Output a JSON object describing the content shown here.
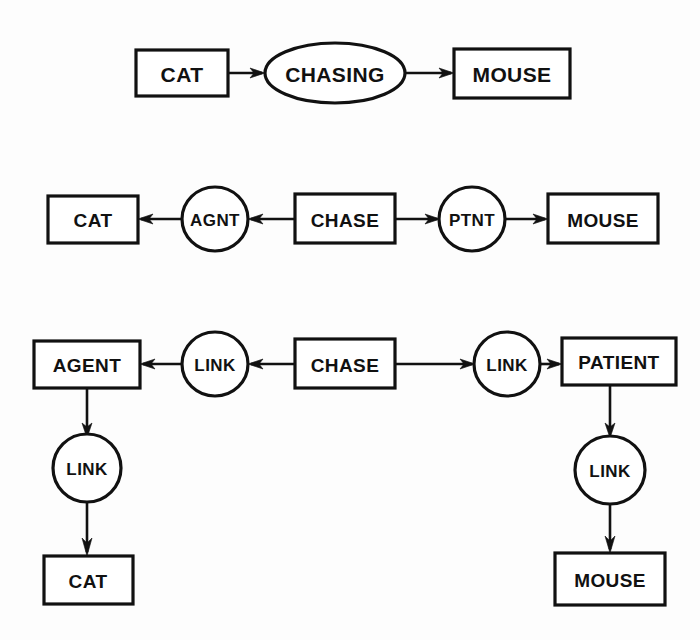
{
  "diagram": {
    "background_color": "#fdfdfd",
    "line_color": "#111111",
    "fill_color": "#ffffff",
    "rows": [
      {
        "id": "row-1",
        "description": "Binary relation: CAT -> CHASING -> MOUSE",
        "nodes": [
          {
            "id": "r1-cat",
            "label": "CAT",
            "shape": "rect"
          },
          {
            "id": "r1-chasing",
            "label": "CHASING",
            "shape": "ellipse"
          },
          {
            "id": "r1-mouse",
            "label": "MOUSE",
            "shape": "rect"
          }
        ],
        "edges": [
          {
            "from": "r1-cat",
            "to": "r1-chasing",
            "direction": "right"
          },
          {
            "from": "r1-chasing",
            "to": "r1-mouse",
            "direction": "right"
          }
        ]
      },
      {
        "id": "row-2",
        "description": "Case-role representation with AGNT and PTNT relations",
        "nodes": [
          {
            "id": "r2-cat",
            "label": "CAT",
            "shape": "rect"
          },
          {
            "id": "r2-agnt",
            "label": "AGNT",
            "shape": "circle"
          },
          {
            "id": "r2-chase",
            "label": "CHASE",
            "shape": "rect"
          },
          {
            "id": "r2-ptnt",
            "label": "PTNT",
            "shape": "circle"
          },
          {
            "id": "r2-mouse",
            "label": "MOUSE",
            "shape": "rect"
          }
        ],
        "edges": [
          {
            "from": "r2-agnt",
            "to": "r2-cat",
            "direction": "left"
          },
          {
            "from": "r2-chase",
            "to": "r2-agnt",
            "direction": "left"
          },
          {
            "from": "r2-chase",
            "to": "r2-ptnt",
            "direction": "right"
          },
          {
            "from": "r2-ptnt",
            "to": "r2-mouse",
            "direction": "right"
          }
        ]
      },
      {
        "id": "row-3",
        "description": "Fully reified representation with LINK nodes to AGENT and PATIENT concepts",
        "nodes": [
          {
            "id": "r3-agent",
            "label": "AGENT",
            "shape": "rect"
          },
          {
            "id": "r3-link-left",
            "label": "LINK",
            "shape": "circle"
          },
          {
            "id": "r3-chase",
            "label": "CHASE",
            "shape": "rect"
          },
          {
            "id": "r3-link-right",
            "label": "LINK",
            "shape": "circle"
          },
          {
            "id": "r3-patient",
            "label": "PATIENT",
            "shape": "rect"
          },
          {
            "id": "r3-link-down-left",
            "label": "LINK",
            "shape": "circle"
          },
          {
            "id": "r3-cat",
            "label": "CAT",
            "shape": "rect"
          },
          {
            "id": "r3-link-down-right",
            "label": "LINK",
            "shape": "circle"
          },
          {
            "id": "r3-mouse",
            "label": "MOUSE",
            "shape": "rect"
          }
        ],
        "edges": [
          {
            "from": "r3-link-left",
            "to": "r3-agent",
            "direction": "left"
          },
          {
            "from": "r3-chase",
            "to": "r3-link-left",
            "direction": "left"
          },
          {
            "from": "r3-chase",
            "to": "r3-link-right",
            "direction": "right"
          },
          {
            "from": "r3-link-right",
            "to": "r3-patient",
            "direction": "right"
          },
          {
            "from": "r3-agent",
            "to": "r3-link-down-left",
            "direction": "down"
          },
          {
            "from": "r3-link-down-left",
            "to": "r3-cat",
            "direction": "down"
          },
          {
            "from": "r3-patient",
            "to": "r3-link-down-right",
            "direction": "down"
          },
          {
            "from": "r3-link-down-right",
            "to": "r3-mouse",
            "direction": "down"
          }
        ]
      }
    ]
  },
  "labels": {
    "r1_cat": "CAT",
    "r1_chasing": "CHASING",
    "r1_mouse": "MOUSE",
    "r2_cat": "CAT",
    "r2_agnt": "AGNT",
    "r2_chase": "CHASE",
    "r2_ptnt": "PTNT",
    "r2_mouse": "MOUSE",
    "r3_agent": "AGENT",
    "r3_link_left": "LINK",
    "r3_chase": "CHASE",
    "r3_link_right": "LINK",
    "r3_patient": "PATIENT",
    "r3_link_down_left": "LINK",
    "r3_cat": "CAT",
    "r3_link_down_right": "LINK",
    "r3_mouse": "MOUSE"
  }
}
